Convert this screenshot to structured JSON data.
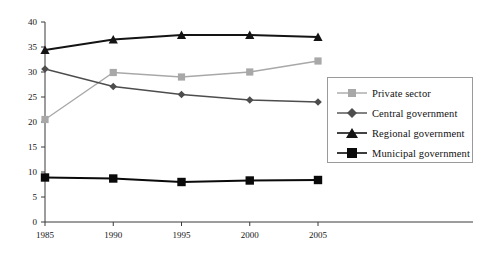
{
  "chart_data": {
    "type": "line",
    "title": "",
    "xlabel": "",
    "ylabel": "",
    "categories": [
      "1985",
      "1990",
      "1995",
      "2000",
      "2005"
    ],
    "x": [
      1985,
      1990,
      1995,
      2000,
      2005
    ],
    "ylim": [
      0,
      40
    ],
    "yticks": [
      0,
      5,
      10,
      15,
      20,
      25,
      30,
      35,
      40
    ],
    "ytick_labels": [
      "0",
      "5",
      "10",
      "15",
      "20",
      "25",
      "30",
      "35",
      "40"
    ],
    "grid": false,
    "legend_position": "right",
    "series": [
      {
        "name": "Private sector",
        "values": [
          20.5,
          29.9,
          29.0,
          30.0,
          32.2
        ],
        "color": "#a8a8a8",
        "marker": "square"
      },
      {
        "name": "Central government",
        "values": [
          30.6,
          27.1,
          25.5,
          24.4,
          24.0
        ],
        "color": "#4d4d4d",
        "marker": "diamond"
      },
      {
        "name": "Regional government",
        "values": [
          34.4,
          36.5,
          37.4,
          37.4,
          37.0
        ],
        "color": "#141414",
        "marker": "triangle"
      },
      {
        "name": "Municipal government",
        "values": [
          8.9,
          8.7,
          8.0,
          8.3,
          8.4
        ],
        "color": "#0a0a0a",
        "marker": "square"
      }
    ]
  },
  "legend": {
    "items": [
      {
        "label": "Private sector"
      },
      {
        "label": "Central government"
      },
      {
        "label": "Regional government"
      },
      {
        "label": "Municipal government"
      }
    ]
  },
  "caption": {
    "text": ""
  }
}
